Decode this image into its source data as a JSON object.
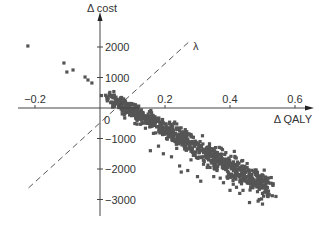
{
  "chart_data": {
    "type": "scatter",
    "title": "",
    "xlabel": "Δ QALY",
    "ylabel": "Δ cost",
    "threshold_label": "λ",
    "xlim": [
      -0.25,
      0.65
    ],
    "ylim": [
      -3500,
      3000
    ],
    "x_ticks": [
      {
        "value": -0.2,
        "label": "−0.2"
      },
      {
        "value": 0.2,
        "label": "0.2"
      },
      {
        "value": 0.4,
        "label": "0.4"
      },
      {
        "value": 0.6,
        "label": "0.6"
      }
    ],
    "y_ticks": [
      {
        "value": 2000,
        "label": "2000"
      },
      {
        "value": 1000,
        "label": "1000"
      },
      {
        "value": -1000,
        "label": "−1000"
      },
      {
        "value": -2000,
        "label": "−2000"
      },
      {
        "value": -3000,
        "label": "−3000"
      }
    ],
    "origin_label": "0",
    "grid": false,
    "legend": null,
    "threshold_line": {
      "style": "dashed",
      "from": [
        -0.22,
        -2620
      ],
      "to": [
        0.28,
        2230
      ]
    },
    "point_color": "#555555",
    "outliers": [
      [
        -0.222,
        2033
      ],
      [
        -0.111,
        1475
      ],
      [
        -0.102,
        1180
      ],
      [
        -0.083,
        1246
      ],
      [
        -0.046,
        1016
      ],
      [
        -0.037,
        918
      ],
      [
        -0.025,
        820
      ]
    ],
    "cloud": {
      "x_range": [
        0.03,
        0.52
      ],
      "trend": {
        "slope": -6000,
        "intercept": 500
      },
      "n_points": 900,
      "spread": 170
    },
    "scattered_points": [
      [
        0.155,
        -1400
      ],
      [
        0.195,
        -1500
      ],
      [
        0.245,
        -1900
      ],
      [
        0.25,
        -2100
      ],
      [
        0.27,
        -2050
      ],
      [
        0.3,
        -2250
      ],
      [
        0.31,
        -2400
      ],
      [
        0.35,
        -2250
      ],
      [
        0.37,
        -2300
      ],
      [
        0.38,
        -2450
      ],
      [
        0.41,
        -2500
      ],
      [
        0.42,
        -2600
      ],
      [
        0.44,
        -2700
      ],
      [
        0.45,
        -2250
      ],
      [
        0.46,
        -2450
      ],
      [
        0.47,
        -2600
      ],
      [
        0.48,
        -2550
      ],
      [
        0.5,
        -2400
      ],
      [
        0.5,
        -2800
      ],
      [
        0.51,
        -2650
      ],
      [
        0.49,
        -3000
      ],
      [
        0.5,
        -3150
      ],
      [
        0.46,
        -3100
      ],
      [
        0.43,
        -2800
      ],
      [
        0.4,
        -2700
      ],
      [
        0.33,
        -1950
      ],
      [
        0.36,
        -2050
      ],
      [
        0.28,
        -1700
      ],
      [
        0.22,
        -1600
      ],
      [
        0.18,
        -1250
      ]
    ]
  }
}
